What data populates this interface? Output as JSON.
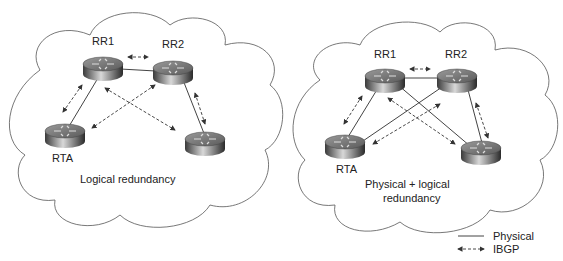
{
  "left": {
    "caption": "Logical redundancy",
    "routers": {
      "rr1": "RR1",
      "rr2": "RR2",
      "rta": "RTA"
    }
  },
  "right": {
    "caption_line1": "Physical + logical",
    "caption_line2": "redundancy",
    "routers": {
      "rr1": "RR1",
      "rr2": "RR2",
      "rta": "RTA"
    }
  },
  "legend": {
    "physical": "Physical",
    "ibgp": "IBGP"
  }
}
